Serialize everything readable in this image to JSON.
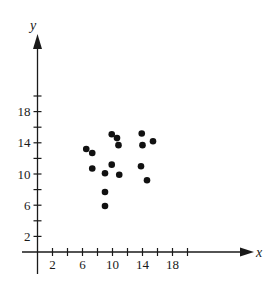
{
  "chart_data": {
    "type": "scatter",
    "title": "",
    "xlabel": "x",
    "ylabel": "y",
    "xlim": [
      -2,
      29
    ],
    "ylim": [
      -3,
      28
    ],
    "x_ticks": [
      2,
      4,
      6,
      8,
      10,
      12,
      14,
      16,
      18,
      20
    ],
    "x_tick_labels": [
      {
        "value": 2,
        "label": "2"
      },
      {
        "value": 6,
        "label": "6"
      },
      {
        "value": 10,
        "label": "10"
      },
      {
        "value": 14,
        "label": "14"
      },
      {
        "value": 18,
        "label": "18"
      }
    ],
    "y_ticks": [
      2,
      4,
      6,
      8,
      10,
      12,
      14,
      16,
      18,
      20
    ],
    "y_tick_labels": [
      {
        "value": 2,
        "label": "2"
      },
      {
        "value": 6,
        "label": "6"
      },
      {
        "value": 10,
        "label": "10"
      },
      {
        "value": 14,
        "label": "14"
      },
      {
        "value": 18,
        "label": "18"
      }
    ],
    "grid": false,
    "legend": null,
    "series": [
      {
        "name": "points",
        "color": "#111111",
        "points": [
          {
            "x": 6.5,
            "y": 13.2
          },
          {
            "x": 7.3,
            "y": 12.7
          },
          {
            "x": 7.3,
            "y": 10.7
          },
          {
            "x": 9.0,
            "y": 10.1
          },
          {
            "x": 9.0,
            "y": 7.7
          },
          {
            "x": 9.0,
            "y": 5.9
          },
          {
            "x": 9.9,
            "y": 11.2
          },
          {
            "x": 9.9,
            "y": 15.1
          },
          {
            "x": 10.6,
            "y": 14.6
          },
          {
            "x": 10.8,
            "y": 13.7
          },
          {
            "x": 10.9,
            "y": 9.9
          },
          {
            "x": 13.9,
            "y": 15.2
          },
          {
            "x": 14.0,
            "y": 13.7
          },
          {
            "x": 13.8,
            "y": 11.0
          },
          {
            "x": 14.6,
            "y": 9.2
          },
          {
            "x": 15.4,
            "y": 14.2
          }
        ]
      }
    ]
  },
  "style": {
    "axis_color": "#1a1a1a",
    "point_color": "#111111",
    "background": "#ffffff"
  }
}
